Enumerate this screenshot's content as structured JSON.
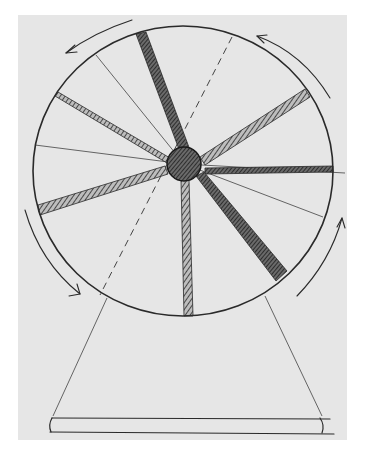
{
  "drawing": {
    "subject": "spinning wheel on trapezoid stand",
    "paper_color": "#e6e6e6",
    "ink_color": "#2a2a2a",
    "wheel": {
      "cx": 185,
      "cy": 170,
      "r": 150
    },
    "hub": {
      "cx": 184,
      "cy": 164,
      "r": 17
    },
    "shaded_spokes": [
      {
        "angle_deg": -108,
        "name": "upper-left-vertical"
      },
      {
        "angle_deg": -150,
        "name": "upper-left"
      },
      {
        "angle_deg": -30,
        "name": "upper-right"
      },
      {
        "angle_deg": 0,
        "name": "right"
      },
      {
        "angle_deg": 162,
        "name": "left-lower"
      },
      {
        "angle_deg": 52,
        "name": "lower-right"
      },
      {
        "angle_deg": 93,
        "name": "bottom"
      }
    ],
    "thin_spokes": [
      -125,
      -168,
      12,
      20
    ],
    "dashed_line": {
      "angle_deg": -68,
      "extends_to_deg": 120
    },
    "rotation_arrows": [
      "top-left",
      "top-right",
      "left",
      "right"
    ],
    "stand": {
      "top_left": [
        107,
        298
      ],
      "top_right": [
        265,
        296
      ],
      "bottom_left": [
        52,
        418
      ],
      "bottom_right": [
        322,
        418
      ]
    },
    "base": {
      "x1": 50,
      "y1": 418,
      "x2": 332,
      "y2": 433
    }
  }
}
